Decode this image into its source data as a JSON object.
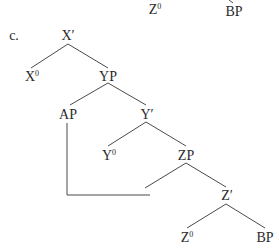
{
  "diagram": {
    "type": "syntax-tree",
    "example_label": "c.",
    "previous_tree_fragment": {
      "left_leaf": {
        "base": "Z",
        "sup": "0"
      },
      "right_leaf": {
        "base": "BP",
        "sup": ""
      }
    },
    "nodes": {
      "x_bar": {
        "base": "X′",
        "sup": ""
      },
      "x_head": {
        "base": "X",
        "sup": "0"
      },
      "yp": {
        "base": "YP",
        "sup": ""
      },
      "ap": {
        "base": "AP",
        "sup": ""
      },
      "y_bar": {
        "base": "Y′",
        "sup": ""
      },
      "y_head": {
        "base": "Y",
        "sup": "0"
      },
      "zp": {
        "base": "ZP",
        "sup": ""
      },
      "z_bar": {
        "base": "Z′",
        "sup": ""
      },
      "z_head": {
        "base": "Z",
        "sup": "0"
      },
      "bp": {
        "base": "BP",
        "sup": ""
      }
    },
    "edges": [
      [
        "X′",
        "X0"
      ],
      [
        "X′",
        "YP"
      ],
      [
        "YP",
        "AP"
      ],
      [
        "YP",
        "Y′"
      ],
      [
        "Y′",
        "Y0"
      ],
      [
        "Y′",
        "ZP"
      ],
      [
        "ZP",
        "(trace)"
      ],
      [
        "ZP",
        "Z′"
      ],
      [
        "Z′",
        "Z0"
      ],
      [
        "Z′",
        "BP"
      ]
    ],
    "movement_line": "AP connected by vertical+horizontal line to the left branch of ZP",
    "line_color": "#4a4a4a",
    "text_color": "#2a2a2a"
  }
}
